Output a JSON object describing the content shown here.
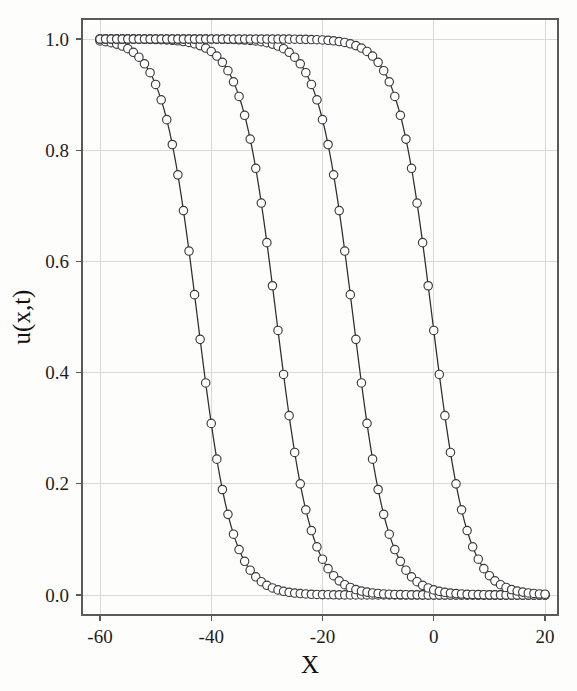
{
  "chart_data": {
    "type": "line",
    "title": "",
    "xlabel": "X",
    "ylabel": "u(x,t)",
    "xlim": [
      -64,
      24
    ],
    "ylim": [
      -0.04,
      1.07
    ],
    "xticks": [
      -60,
      -40,
      -20,
      0,
      20
    ],
    "xtick_labels": [
      "-60",
      "-40",
      "-20",
      "0",
      "20"
    ],
    "yticks": [
      0.0,
      0.2,
      0.4,
      0.6,
      0.8,
      1.0
    ],
    "ytick_labels": [
      "0.0",
      "0.2",
      "0.4",
      "0.6",
      "0.8",
      "1.0"
    ],
    "grid": true,
    "legend": "none",
    "marker": "open-circle",
    "marker_size": 4.2,
    "line_color": "#2e2e2e",
    "marker_edge_color": "#3a3a3a",
    "marker_face_color": "#ffffff",
    "grid_color": "#d9d9d9",
    "frame_color": "#5a5a5a",
    "series": [
      {
        "name": "profile-1",
        "front_center": -42.5,
        "width": 3.1,
        "amplitude": 1.0,
        "x_start": -60,
        "x_end": 20,
        "x_step": 1.0
      },
      {
        "name": "profile-2",
        "front_center": -28.3,
        "width": 3.1,
        "amplitude": 1.0,
        "x_start": -60,
        "x_end": 20,
        "x_step": 1.0
      },
      {
        "name": "profile-3",
        "front_center": -14.5,
        "width": 3.1,
        "amplitude": 1.0,
        "x_start": -60,
        "x_end": 20,
        "x_step": 1.0
      },
      {
        "name": "profile-4",
        "front_center": -0.3,
        "width": 3.1,
        "amplitude": 1.0,
        "x_start": -60,
        "x_end": 20,
        "x_step": 1.0
      }
    ],
    "sampled_points_note": "Each profile is u(x) = 1/(1+exp((x-front_center)/width)) sampled every 1.0 in x from -60 to 20"
  },
  "plot_geometry": {
    "frame_left_px": 82,
    "frame_right_px": 558,
    "frame_top_px": 19,
    "frame_bottom_px": 615
  }
}
